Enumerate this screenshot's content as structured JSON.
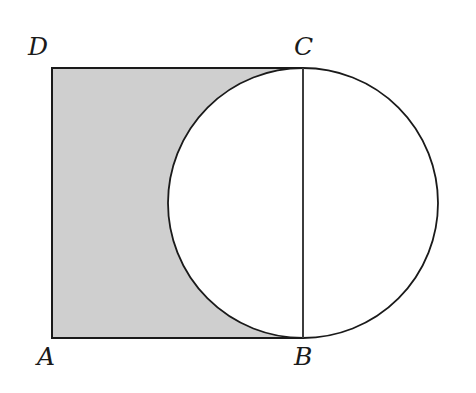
{
  "figure": {
    "background_color": "#ffffff",
    "stroke_color": "#1a1a1a",
    "shaded_fill_color": "#cfcfcf",
    "unshaded_fill_color": "#ffffff",
    "labels": {
      "top_left": "D",
      "top_right": "C",
      "bottom_left": "A",
      "bottom_right": "B"
    }
  },
  "chart_data": {
    "type": "diagram",
    "title": "",
    "grid": false,
    "legend": null,
    "xlabel": "",
    "ylabel": "",
    "shapes": [
      {
        "name": "rectangle-ABCD",
        "kind": "rectangle",
        "vertices": {
          "A": [
            52,
            338
          ],
          "B": [
            303,
            338
          ],
          "C": [
            303,
            68
          ],
          "D": [
            52,
            68
          ]
        },
        "width": 251,
        "height": 270,
        "fill": "#cfcfcf",
        "stroke": "#1a1a1a",
        "stroke_width": 2
      },
      {
        "name": "circle",
        "kind": "circle",
        "center": [
          303,
          203
        ],
        "radius": 135,
        "fill": "#ffffff",
        "stroke": "#1a1a1a",
        "stroke_width": 2,
        "passes_through": [
          "B",
          "C"
        ],
        "note": "Circle has chord BC equal to the right side of the rectangle; its left arc cuts into the shaded rectangle."
      },
      {
        "name": "chord-BC",
        "kind": "segment",
        "from": [
          303,
          68
        ],
        "to": [
          303,
          338
        ],
        "stroke": "#1a1a1a",
        "stroke_width": 1,
        "length": 270
      }
    ],
    "annotations": [
      {
        "text": "D",
        "x": 38,
        "y": 52,
        "anchor": "vertex-D"
      },
      {
        "text": "C",
        "x": 304,
        "y": 52,
        "anchor": "vertex-C"
      },
      {
        "text": "A",
        "x": 47,
        "y": 362,
        "anchor": "vertex-A"
      },
      {
        "text": "B",
        "x": 304,
        "y": 362,
        "anchor": "vertex-B"
      }
    ]
  }
}
